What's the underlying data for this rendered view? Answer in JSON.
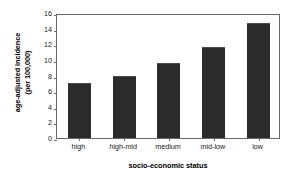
{
  "chart_data": {
    "type": "bar",
    "title": "",
    "categories": [
      "high",
      "high-mid",
      "medium",
      "mid-low",
      "low"
    ],
    "values": [
      7.0,
      8.0,
      9.6,
      11.7,
      14.7
    ],
    "xlabel": "socio-economic status",
    "ylabel": "age-adjusted incidence (per 100,000)",
    "ylabel_line1": "age-adjusted incidence",
    "ylabel_line2": "(per 100,000)",
    "ylim": [
      0,
      16
    ],
    "ytick_labels": [
      "0",
      "2",
      "4",
      "6",
      "8",
      "10",
      "12",
      "14",
      "16"
    ],
    "ytick_values": [
      0,
      2,
      4,
      6,
      8,
      10,
      12,
      14,
      16
    ],
    "grid": false,
    "legend": "none",
    "bar_color": "#2b2b2b",
    "frame_color": "#6b6b6b",
    "background_color": "#ffffff"
  }
}
